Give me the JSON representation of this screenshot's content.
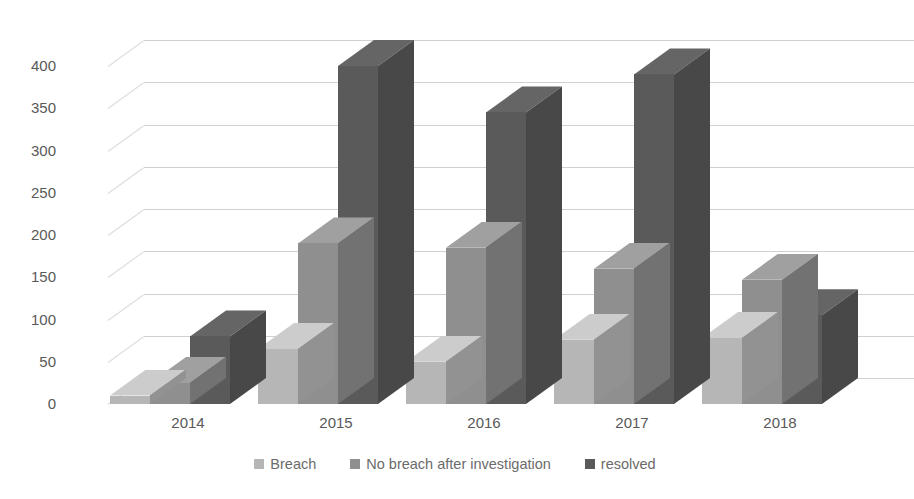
{
  "chart_data": {
    "type": "bar",
    "title": "",
    "subtitle": "",
    "xlabel": "",
    "ylabel": "",
    "categories": [
      "2014",
      "2015",
      "2016",
      "2017",
      "2018"
    ],
    "series": [
      {
        "name": "Breach",
        "color": "#b6b6b6",
        "values": [
          10,
          65,
          50,
          76,
          78
        ]
      },
      {
        "name": "No breach after investigation",
        "color": "#8f8f8f",
        "values": [
          25,
          190,
          185,
          160,
          147
        ]
      },
      {
        "name": "resolved",
        "color": "#5a5a5a",
        "values": [
          80,
          400,
          345,
          390,
          105
        ]
      }
    ],
    "ylim": [
      0,
      450
    ],
    "yticks": [
      0,
      50,
      100,
      150,
      200,
      250,
      300,
      350,
      400
    ],
    "ytick_labels": [
      "0",
      "50",
      "100",
      "150",
      "200",
      "250",
      "300",
      "350",
      "400"
    ],
    "grid": true,
    "legend_position": "bottom",
    "style": "3d-clustered-column",
    "grid_color": "#d9d9d9",
    "text_color": "#595959",
    "background": "#ffffff"
  },
  "legend": {
    "items": [
      {
        "label": "Breach",
        "color": "#b6b6b6"
      },
      {
        "label": "No breach after investigation",
        "color": "#8f8f8f"
      },
      {
        "label": "resolved",
        "color": "#5a5a5a"
      }
    ]
  }
}
